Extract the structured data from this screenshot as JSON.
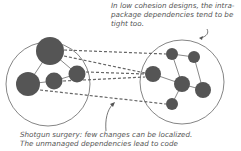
{
  "annotations": {
    "top": {
      "lines": [
        "In low cohesion designs, the intra-",
        "package dependencies tend to be",
        "tight too."
      ]
    },
    "bottom": {
      "lines": [
        "Shotgun surgery: few changes can be localized.",
        "The unmanaged dependencies lead to code"
      ]
    }
  },
  "colors": {
    "node": "#555555",
    "outline": "#666666",
    "dashed": "#666666",
    "text": "#555555"
  },
  "packages": [
    {
      "name": "left-package",
      "cx": 48,
      "cy": 84,
      "r": 42
    },
    {
      "name": "right-package",
      "cx": 182,
      "cy": 82,
      "r": 42
    }
  ]
}
